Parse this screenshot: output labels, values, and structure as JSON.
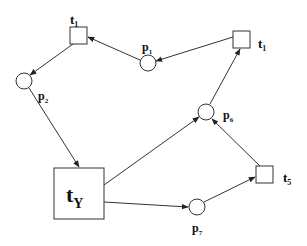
{
  "diagram": {
    "type": "petri-net",
    "places": [
      {
        "id": "p1",
        "label": "p",
        "sub": "1",
        "cx": 148,
        "cy": 63,
        "r": 8,
        "lx": 142,
        "ly": 51
      },
      {
        "id": "p2",
        "label": "p",
        "sub": "2",
        "cx": 24,
        "cy": 81,
        "r": 8,
        "lx": 38,
        "ly": 100
      },
      {
        "id": "p6",
        "label": "p",
        "sub": "6",
        "cx": 206,
        "cy": 112,
        "r": 8,
        "lx": 223,
        "ly": 119
      },
      {
        "id": "p7",
        "label": "p",
        "sub": "7",
        "cx": 197,
        "cy": 207,
        "r": 8,
        "lx": 192,
        "ly": 232
      }
    ],
    "transitions": [
      {
        "id": "t1a",
        "label": "t",
        "sub": "1",
        "x": 70,
        "y": 27,
        "w": 17,
        "h": 17,
        "lx": 70,
        "ly": 24,
        "size": 13
      },
      {
        "id": "t1b",
        "label": "t",
        "sub": "1",
        "x": 233,
        "y": 31,
        "w": 17,
        "h": 17,
        "lx": 258,
        "ly": 48,
        "size": 13
      },
      {
        "id": "tY",
        "label": "t",
        "sub": "Y",
        "x": 54,
        "y": 168,
        "w": 50,
        "h": 51,
        "lx": 66,
        "ly": 202,
        "size": 22
      },
      {
        "id": "t5",
        "label": "t",
        "sub": "5",
        "x": 256,
        "y": 166,
        "w": 17,
        "h": 17,
        "lx": 283,
        "ly": 182,
        "size": 13
      }
    ],
    "arcs": [
      {
        "from": "t1b",
        "to": "p1",
        "x1": 233,
        "y1": 37,
        "x2": 156,
        "y2": 61
      },
      {
        "from": "p1",
        "to": "t1a",
        "x1": 140,
        "y1": 60,
        "x2": 88,
        "y2": 37
      },
      {
        "from": "t1a",
        "to": "p2",
        "x1": 73,
        "y1": 44,
        "x2": 30,
        "y2": 75
      },
      {
        "from": "p2",
        "to": "tY",
        "x1": 29,
        "y1": 88,
        "x2": 79,
        "y2": 167
      },
      {
        "from": "tY",
        "to": "p6",
        "x1": 104,
        "y1": 185,
        "x2": 199,
        "y2": 117
      },
      {
        "from": "tY",
        "to": "p7",
        "x1": 104,
        "y1": 202,
        "x2": 188,
        "y2": 207
      },
      {
        "from": "p7",
        "to": "t5",
        "x1": 204,
        "y1": 202,
        "x2": 255,
        "y2": 177
      },
      {
        "from": "t5",
        "to": "p6",
        "x1": 260,
        "y1": 166,
        "x2": 212,
        "y2": 119
      },
      {
        "from": "p6",
        "to": "t1b",
        "x1": 210,
        "y1": 104,
        "x2": 240,
        "y2": 49
      }
    ]
  }
}
